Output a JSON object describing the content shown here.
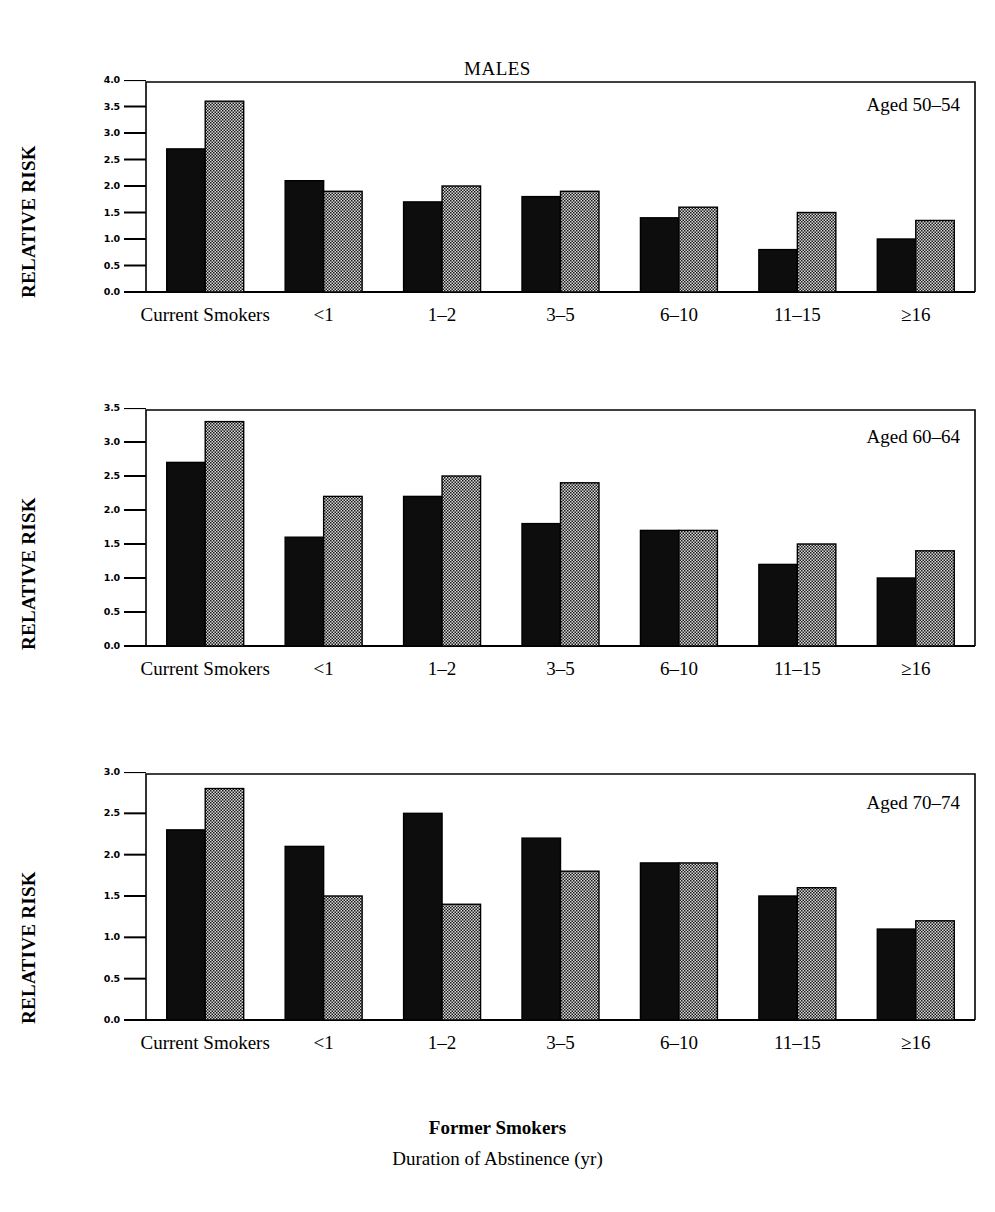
{
  "figure": {
    "title": "MALES",
    "y_axis_label": "RELATIVE RISK",
    "footer_line_1": "Former Smokers",
    "footer_line_2": "Duration of Abstinence (yr)"
  },
  "legend": {
    "series_1_name": "Series 1 (black)",
    "series_2_name": "Series 2 (stippled)",
    "series_1_color": "#000000",
    "series_2_color": "#c8c8c8"
  },
  "chart_data": [
    {
      "type": "bar",
      "title": "MALES",
      "panel_label": "Aged 50-54",
      "panel_label_display": "Aged 50–54",
      "xlabel": "Former Smokers Duration of Abstinence (yr)",
      "ylabel": "RELATIVE RISK",
      "ylim": [
        0.0,
        4.0
      ],
      "ytick_labels": [
        "4.0",
        "3.5",
        "3.0",
        "2.5",
        "2.0",
        "1.5",
        "1.0",
        "0.5",
        "0.0"
      ],
      "yticks": [
        4.0,
        3.5,
        3.0,
        2.5,
        2.0,
        1.5,
        1.0,
        0.5,
        0.0
      ],
      "grid": false,
      "legend_position": "none",
      "categories": [
        "Current Smokers",
        "<1",
        "1–2",
        "3–5",
        "6–10",
        "11–15",
        "≥16"
      ],
      "series": [
        {
          "name": "Series 1 (black)",
          "values": [
            2.7,
            2.1,
            1.7,
            1.8,
            1.4,
            0.8,
            1.0
          ]
        },
        {
          "name": "Series 2 (stippled)",
          "values": [
            3.6,
            1.9,
            2.0,
            1.9,
            1.6,
            1.5,
            1.35
          ]
        }
      ]
    },
    {
      "type": "bar",
      "panel_label": "Aged 60-64",
      "panel_label_display": "Aged 60–64",
      "xlabel": "Former Smokers Duration of Abstinence (yr)",
      "ylabel": "RELATIVE RISK",
      "ylim": [
        0.0,
        3.5
      ],
      "ytick_labels": [
        "3.5",
        "3.0",
        "2.5",
        "2.0",
        "1.5",
        "1.0",
        "0.5",
        "0.0"
      ],
      "yticks": [
        3.5,
        3.0,
        2.5,
        2.0,
        1.5,
        1.0,
        0.5,
        0.0
      ],
      "grid": false,
      "legend_position": "none",
      "categories": [
        "Current Smokers",
        "<1",
        "1–2",
        "3–5",
        "6–10",
        "11–15",
        "≥16"
      ],
      "series": [
        {
          "name": "Series 1 (black)",
          "values": [
            2.7,
            1.6,
            2.2,
            1.8,
            1.7,
            1.2,
            1.0
          ]
        },
        {
          "name": "Series 2 (stippled)",
          "values": [
            3.3,
            2.2,
            2.5,
            2.4,
            1.7,
            1.5,
            1.4
          ]
        }
      ]
    },
    {
      "type": "bar",
      "panel_label": "Aged 70-74",
      "panel_label_display": "Aged 70–74",
      "xlabel": "Former Smokers Duration of Abstinence (yr)",
      "ylabel": "RELATIVE RISK",
      "ylim": [
        0.0,
        3.0
      ],
      "ytick_labels": [
        "3.0",
        "2.5",
        "2.0",
        "1.5",
        "1.0",
        "0.5",
        "0.0"
      ],
      "yticks": [
        3.0,
        2.5,
        2.0,
        1.5,
        1.0,
        0.5,
        0.0
      ],
      "grid": false,
      "legend_position": "none",
      "categories": [
        "Current Smokers",
        "<1",
        "1–2",
        "3–5",
        "6–10",
        "11–15",
        "≥16"
      ],
      "series": [
        {
          "name": "Series 1 (black)",
          "values": [
            2.3,
            2.1,
            2.5,
            2.2,
            1.9,
            1.5,
            1.1
          ]
        },
        {
          "name": "Series 2 (stippled)",
          "values": [
            2.8,
            1.5,
            1.4,
            1.8,
            1.9,
            1.6,
            1.2
          ]
        }
      ]
    }
  ]
}
